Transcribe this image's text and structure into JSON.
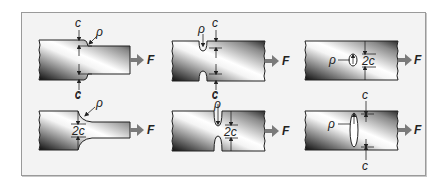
{
  "figure": {
    "colors": {
      "panel_bg": "#f3f3f3",
      "panel_border": "#9a9a9a",
      "outline": "#222222",
      "arrow": "#7a7a7a",
      "gradient_dark": "#111111",
      "gradient_light": "#ffffff"
    },
    "panels": [
      {
        "id": "shoulder-step",
        "labels": {
          "top": "c",
          "bottom": "c",
          "radius": "ρ",
          "force": "F"
        }
      },
      {
        "id": "double-notch-shallow",
        "labels": {
          "top": "c",
          "bottom": "c",
          "radius": "ρ",
          "force": "F"
        }
      },
      {
        "id": "small-hole",
        "labels": {
          "width": "2c",
          "radius": "ρ",
          "force": "F"
        }
      },
      {
        "id": "shoulder-fillet",
        "labels": {
          "top": "c",
          "width": "2c",
          "radius": "ρ",
          "force": "F"
        }
      },
      {
        "id": "double-notch-deep",
        "labels": {
          "top": "c",
          "width": "2c",
          "radius": "ρ",
          "force": "F"
        }
      },
      {
        "id": "elliptical-hole",
        "labels": {
          "top": "c",
          "bottom": "c",
          "radius": "ρ",
          "force": "F"
        }
      }
    ]
  }
}
